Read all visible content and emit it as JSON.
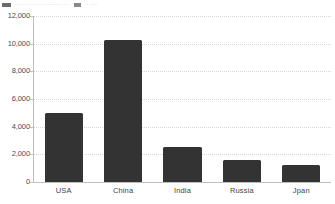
{
  "legend": {
    "entry_1_text": "······ ······ ··· ········· ·· ·",
    "entry_2_text": "·· ····"
  },
  "chart_data": {
    "type": "bar",
    "title": "",
    "subtitle": "",
    "xlabel": "",
    "ylabel": "",
    "categories": [
      "USA",
      "China",
      "India",
      "Russia",
      "Jpan"
    ],
    "values": [
      5000,
      10300,
      2500,
      1600,
      1200
    ],
    "series": [
      {
        "name": "",
        "values": [
          5000,
          10300,
          2500,
          1600,
          1200
        ]
      }
    ],
    "ylim": [
      0,
      12000
    ],
    "ytick_values": [
      0,
      2000,
      4000,
      6000,
      8000,
      10000,
      12000
    ],
    "ytick_labels": [
      "0",
      "2,000",
      "4,000",
      "6,000",
      "8,000",
      "10,000",
      "12,000"
    ],
    "grid": true,
    "grid_axis": "y",
    "legend_position": "top",
    "orientation": "vertical",
    "colors": {
      "bar_fill": "#333333",
      "gridline": "#d8d8d8",
      "axis_line": "#bdbdbd",
      "tick_label": "#4c4c4c",
      "category_label": "#3f3f3f",
      "background": "#ffffff"
    }
  }
}
